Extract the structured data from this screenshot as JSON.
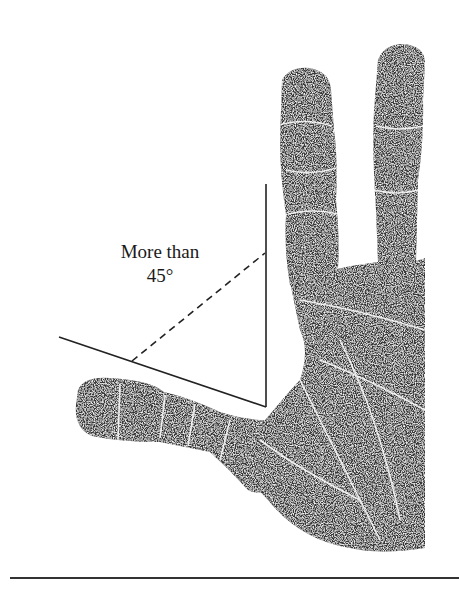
{
  "figure": {
    "annotation": {
      "line1": "More than",
      "line2": "45°"
    },
    "angle_lines": {
      "vertical": {
        "x1": 266,
        "y1": 184,
        "x2": 266,
        "y2": 407
      },
      "slanted": {
        "x1": 59,
        "y1": 337,
        "x2": 266,
        "y2": 407
      },
      "dashed": {
        "x1": 132,
        "y1": 361,
        "x2": 265,
        "y2": 253
      }
    },
    "colors": {
      "ink": "#2e2e2e",
      "line": "#222222",
      "background": "#ffffff"
    }
  }
}
